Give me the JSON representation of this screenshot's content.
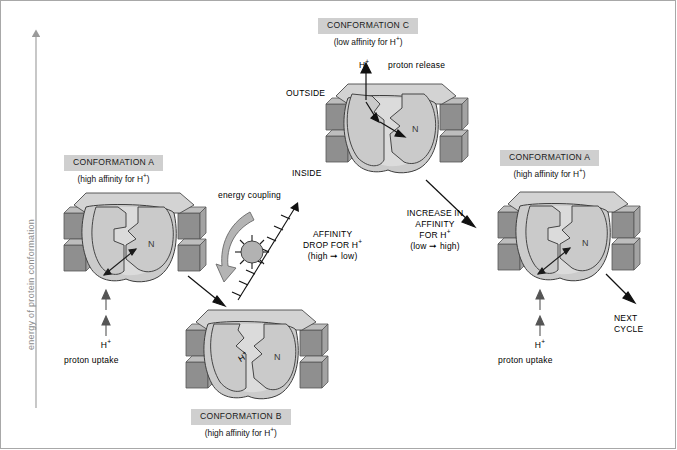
{
  "figure": {
    "axis_label": "energy of protein conformation",
    "background": "#ffffff",
    "border_color": "#a8a8a8",
    "label_box_fill": "#cfcfcf",
    "protein_fill": "#c9c9c9",
    "protein_light": "#dcdcdc",
    "membrane_dark": "#949494",
    "membrane_mid": "#b0b0b0",
    "membrane_top": "#d6d6d6"
  },
  "conformations": {
    "a_left": {
      "title": "CONFORMATION A",
      "subtitle_pre": "(high affinity for H",
      "subtitle_sup": "+",
      "subtitle_post": ")",
      "site_label": "N",
      "proton_symbol": "H",
      "proton_charge": "+",
      "proton_caption": "proton uptake"
    },
    "b_bottom": {
      "title": "CONFORMATION B",
      "subtitle_pre": "(high affinity for H",
      "subtitle_sup": "+",
      "subtitle_post": ")",
      "site_label": "N",
      "bound_proton": "H",
      "bound_proton_charge": "+"
    },
    "c_top": {
      "title": "CONFORMATION C",
      "subtitle_pre": "(low affinity for H",
      "subtitle_sup": "+",
      "subtitle_post": ")",
      "site_label": "N",
      "proton_symbol": "H",
      "proton_charge": "+",
      "release_caption": "proton release",
      "outside_label": "OUTSIDE",
      "inside_label": "INSIDE"
    },
    "a_right": {
      "title": "CONFORMATION A",
      "subtitle_pre": "(high affinity for H",
      "subtitle_sup": "+",
      "subtitle_post": ")",
      "site_label": "N",
      "proton_symbol": "H",
      "proton_charge": "+",
      "proton_caption": "proton uptake"
    }
  },
  "annotations": {
    "energy_coupling": "energy coupling",
    "affinity_drop_line1": "AFFINITY",
    "affinity_drop_line2_pre": "DROP FOR H",
    "affinity_drop_line2_sup": "+",
    "affinity_drop_line3": "(high ➞ low)",
    "affinity_increase_line1": "INCREASE IN",
    "affinity_increase_line2": "AFFINITY",
    "affinity_increase_line3_pre": "FOR H",
    "affinity_increase_line3_sup": "+",
    "affinity_increase_line4": "(low ➞ high)",
    "next_cycle_line1": "NEXT",
    "next_cycle_line2": "CYCLE"
  }
}
